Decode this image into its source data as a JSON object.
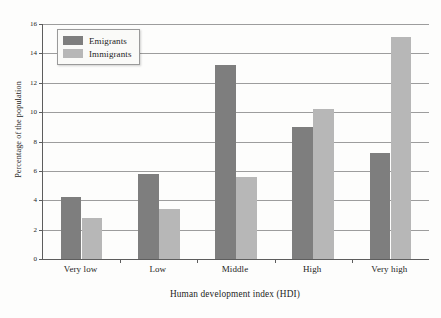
{
  "chart_data": {
    "type": "bar",
    "title": "",
    "xlabel": "Human development index (HDI)",
    "ylabel": "Percentage of the population",
    "categories": [
      "Very low",
      "Low",
      "Middle",
      "High",
      "Very high"
    ],
    "series": [
      {
        "name": "Emigrants",
        "color": "#7e7e7e",
        "values": [
          4.2,
          5.8,
          13.2,
          9.0,
          7.2
        ]
      },
      {
        "name": "Immigrants",
        "color": "#b7b7b7",
        "values": [
          2.8,
          3.4,
          5.6,
          10.2,
          15.1
        ]
      }
    ],
    "ylim": [
      0,
      16
    ],
    "yticks": [
      0,
      2,
      4,
      6,
      8,
      10,
      12,
      14,
      16
    ],
    "ytick_labels": [
      "0",
      "2",
      "4",
      "6",
      "8",
      "10",
      "12",
      "14",
      "16"
    ],
    "grid": true,
    "grid_axis": "y",
    "legend_position": "upper left",
    "legend_entries": [
      "Emigrants",
      "Immigrants"
    ],
    "background_color": "#fdfdfc",
    "axis_color": "#5d5d5d",
    "grid_color": "#8c8c8c"
  }
}
